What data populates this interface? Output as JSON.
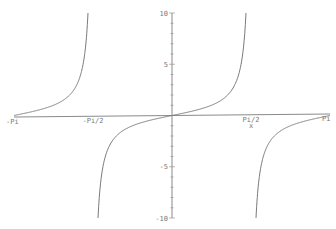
{
  "chart_data": {
    "type": "line",
    "title": "",
    "function": "tan(x)",
    "xlabel": "x",
    "ylabel": "",
    "xlim": [
      -3.14159,
      3.14159
    ],
    "ylim": [
      -10,
      10
    ],
    "grid": false,
    "legend": null,
    "x_ticks": [
      {
        "value": -3.14159,
        "label": "-Pi"
      },
      {
        "value": -1.5708,
        "label": "-Pi/2"
      },
      {
        "value": 1.5708,
        "label": "Pi/2"
      },
      {
        "value": 3.14159,
        "label": "Pi"
      }
    ],
    "y_ticks": [
      {
        "value": 10,
        "label": "10"
      },
      {
        "value": 5,
        "label": "5"
      },
      {
        "value": -5,
        "label": "-5"
      },
      {
        "value": -10,
        "label": "-10"
      }
    ],
    "series": [
      {
        "name": "tan(x) branch 1",
        "x_range": [
          -3.14159,
          -1.6705
        ],
        "description": "rises from 0 at -Pi to 10 near -Pi/2"
      },
      {
        "name": "tan(x) branch 2",
        "x_range": [
          -1.4711,
          1.4711
        ],
        "description": "rises from -10 through 0 to 10"
      },
      {
        "name": "tan(x) branch 3",
        "x_range": [
          1.6705,
          3.14159
        ],
        "description": "rises from -10 near Pi/2 to 0 at Pi"
      }
    ],
    "colors": {
      "curve": "#7a7a7a",
      "axis": "#8a8a8a",
      "labels": "#777777"
    }
  },
  "axes": {
    "x_axis_label": "x"
  }
}
